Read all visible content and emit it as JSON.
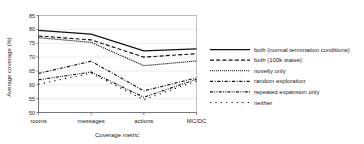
{
  "chart_data": {
    "type": "line",
    "title": "",
    "xlabel": "Coverage metric",
    "ylabel": "Average coverage (%)",
    "categories": [
      "rooms",
      "messages",
      "actions",
      "MC/DC"
    ],
    "ylim": [
      50,
      85
    ],
    "yticks": [
      50,
      55,
      60,
      65,
      70,
      75,
      80,
      85
    ],
    "ytick_labels": [
      "50",
      "55",
      "60",
      "65",
      "70",
      "75",
      "80",
      "85"
    ],
    "grid": true,
    "grid_axis": "y",
    "legend_position": "right",
    "line_color": "#111111",
    "series": [
      {
        "name": "both (normal termination conditions)",
        "style": "solid",
        "values": [
          79.6,
          78.3,
          72.2,
          73.0
        ]
      },
      {
        "name": "both (100k states)",
        "style": "dashed",
        "values": [
          77.6,
          76.2,
          70.0,
          71.2
        ]
      },
      {
        "name": "novelty only",
        "style": "fine-dotted",
        "values": [
          77.0,
          75.3,
          66.9,
          68.6
        ]
      },
      {
        "name": "random exploration",
        "style": "dash-dot",
        "values": [
          64.1,
          68.5,
          57.8,
          62.5
        ]
      },
      {
        "name": "repeated expansion only",
        "style": "dash-dot-dot",
        "values": [
          61.8,
          64.6,
          55.5,
          62.0
        ]
      },
      {
        "name": "neither",
        "style": "sparse-dotted",
        "values": [
          60.2,
          64.2,
          54.6,
          61.4
        ]
      }
    ]
  },
  "legend": {
    "entries": [
      {
        "label": "both (normal termination conditions)"
      },
      {
        "label": "both (100k states)"
      },
      {
        "label": "novelty only"
      },
      {
        "label": "random exploration"
      },
      {
        "label": "repeated expansion only"
      },
      {
        "label": "neither"
      }
    ]
  }
}
